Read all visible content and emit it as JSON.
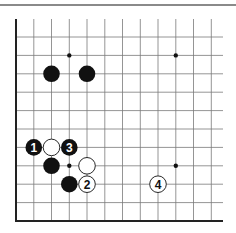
{
  "diagram": {
    "type": "go-board-diagram",
    "region": "lower-left corner",
    "columns_x": [
      16,
      33.8,
      51.5,
      69.3,
      87,
      104.8,
      122.5,
      140.3,
      158,
      175.8,
      193.5,
      211.3
    ],
    "rows_y": [
      37,
      55.4,
      73.8,
      92.2,
      110.6,
      129,
      147.4,
      165.8,
      184.2,
      202.6,
      221
    ],
    "grid_top_y": 19,
    "grid_right_x": 223,
    "colors": {
      "line": "#7a7a7a",
      "border": "#222222",
      "black_stone": "#111111",
      "white_stone": "#ffffff",
      "star": "#111111"
    },
    "star_points": [
      {
        "col": 3,
        "row": 1
      },
      {
        "col": 9,
        "row": 1
      },
      {
        "col": 3,
        "row": 7
      },
      {
        "col": 9,
        "row": 7
      }
    ],
    "stones": [
      {
        "color": "black",
        "col": 2,
        "row": 2,
        "label": ""
      },
      {
        "color": "black",
        "col": 4,
        "row": 2,
        "label": ""
      },
      {
        "color": "black",
        "col": 1,
        "row": 6,
        "label": "1"
      },
      {
        "color": "white",
        "col": 2,
        "row": 6,
        "label": ""
      },
      {
        "color": "black",
        "col": 3,
        "row": 6,
        "label": "3"
      },
      {
        "color": "black",
        "col": 2,
        "row": 7,
        "label": ""
      },
      {
        "color": "white",
        "col": 4,
        "row": 7,
        "label": ""
      },
      {
        "color": "black",
        "col": 3,
        "row": 8,
        "label": ""
      },
      {
        "color": "white",
        "col": 4,
        "row": 8,
        "label": "2"
      },
      {
        "color": "white",
        "col": 8,
        "row": 8,
        "label": "4"
      }
    ]
  }
}
